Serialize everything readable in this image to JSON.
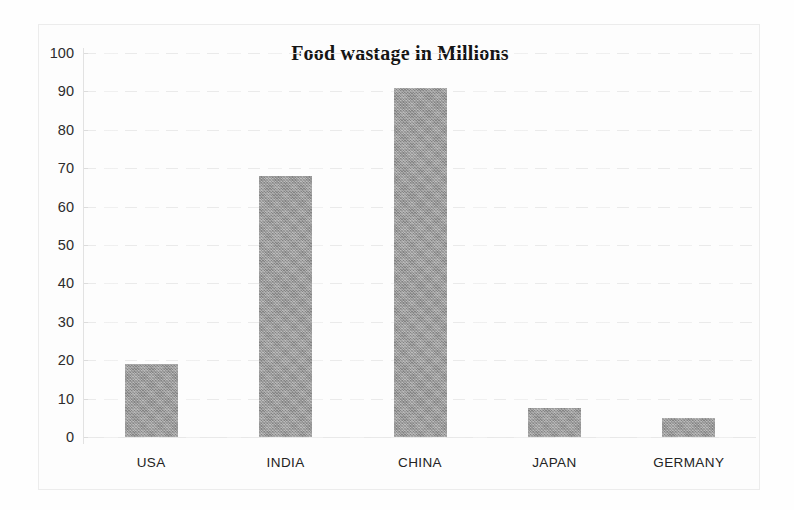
{
  "chart_data": {
    "type": "bar",
    "title": "Food wastage in Millions",
    "categories": [
      "USA",
      "INDIA",
      "CHINA",
      "JAPAN",
      "GERMANY"
    ],
    "values": [
      19,
      68,
      91,
      7.5,
      5
    ],
    "xlabel": "",
    "ylabel": "",
    "ylim": [
      0,
      100
    ],
    "ytick_step": 10,
    "yticks": [
      0,
      10,
      20,
      30,
      40,
      50,
      60,
      70,
      80,
      90,
      100
    ],
    "ytick_labels": [
      "0",
      "10",
      "20",
      "30",
      "40",
      "50",
      "60",
      "70",
      "80",
      "90",
      "100"
    ],
    "grid": true,
    "grid_axis": "y",
    "legend": false,
    "legend_position": "none",
    "series": [
      {
        "name": "Food wastage",
        "values": [
          19,
          68,
          91,
          7.5,
          5
        ]
      }
    ],
    "colors": {
      "bar_fill": "#9b9b9b",
      "background": "#fdfdfd",
      "grid": "#e9e9e9",
      "axis": "#e2e2e2",
      "title_text": "#151515",
      "tick_text": "#2c2c2c"
    }
  }
}
